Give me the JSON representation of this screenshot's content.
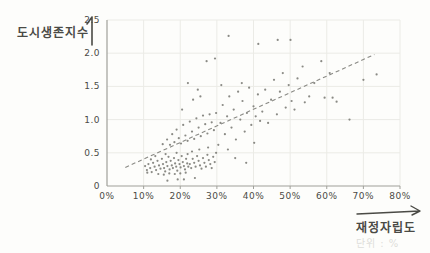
{
  "page": {
    "background": "#fdfdfb"
  },
  "chart_data": {
    "type": "scatter",
    "title": "",
    "ylabel": "도시생존지수",
    "xlabel": "재정자립도",
    "unit_note": "단위 : %",
    "xlim": [
      0,
      80
    ],
    "ylim": [
      0,
      2.5
    ],
    "x_tick_values": [
      0,
      10,
      20,
      30,
      40,
      50,
      60,
      70,
      80
    ],
    "x_tick_labels": [
      "0%",
      "10%",
      "20%",
      "30%",
      "40%",
      "50%",
      "60%",
      "70%",
      "80%"
    ],
    "y_tick_values": [
      0,
      0.5,
      1.0,
      1.5,
      2.0,
      2.5
    ],
    "y_tick_labels": [
      "0",
      "0.5",
      "1.0",
      "1.5",
      "2.0",
      "2.5"
    ],
    "grid": true,
    "legend": "none",
    "trend_line": {
      "style": "dashed",
      "from": {
        "x": 5,
        "y": 0.28
      },
      "to": {
        "x": 73,
        "y": 1.98
      }
    },
    "colors": {
      "point": "#7d7d78",
      "trend": "#8a8a85",
      "grid": "#ebebe6",
      "axis": "#a0a09a",
      "tick_text": "#4b4b46",
      "label_text": "#4a4a45",
      "unit_text": "#dededa"
    },
    "points": [
      [
        10.4,
        0.3
      ],
      [
        10.9,
        0.24
      ],
      [
        11.3,
        0.33
      ],
      [
        11.8,
        0.27
      ],
      [
        12.2,
        0.21
      ],
      [
        12.6,
        0.35
      ],
      [
        13.0,
        0.29
      ],
      [
        13.4,
        0.24
      ],
      [
        13.8,
        0.38
      ],
      [
        14.2,
        0.31
      ],
      [
        14.6,
        0.26
      ],
      [
        15.0,
        0.41
      ],
      [
        15.3,
        0.33
      ],
      [
        15.6,
        0.27
      ],
      [
        15.9,
        0.22
      ],
      [
        16.2,
        0.36
      ],
      [
        16.5,
        0.3
      ],
      [
        16.8,
        0.44
      ],
      [
        17.1,
        0.25
      ],
      [
        17.4,
        0.38
      ],
      [
        17.7,
        0.31
      ],
      [
        18.0,
        0.27
      ],
      [
        18.3,
        0.42
      ],
      [
        18.6,
        0.34
      ],
      [
        18.9,
        0.29
      ],
      [
        19.2,
        0.23
      ],
      [
        19.5,
        0.39
      ],
      [
        19.8,
        0.33
      ],
      [
        20.1,
        0.28
      ],
      [
        20.4,
        0.45
      ],
      [
        20.7,
        0.36
      ],
      [
        21.0,
        0.3
      ],
      [
        21.3,
        0.25
      ],
      [
        21.6,
        0.41
      ],
      [
        21.9,
        0.34
      ],
      [
        22.2,
        0.29
      ],
      [
        14.0,
        0.18
      ],
      [
        15.5,
        0.17
      ],
      [
        17.0,
        0.19
      ],
      [
        18.5,
        0.18
      ],
      [
        20.0,
        0.19
      ],
      [
        21.5,
        0.2
      ],
      [
        13.2,
        0.45
      ],
      [
        16.0,
        0.48
      ],
      [
        19.0,
        0.5
      ],
      [
        12.0,
        0.4
      ],
      [
        22.0,
        0.48
      ],
      [
        11.0,
        0.2
      ],
      [
        22.6,
        0.33
      ],
      [
        23.0,
        0.27
      ],
      [
        23.4,
        0.41
      ],
      [
        23.8,
        0.35
      ],
      [
        24.2,
        0.29
      ],
      [
        24.6,
        0.45
      ],
      [
        25.0,
        0.38
      ],
      [
        25.4,
        0.31
      ],
      [
        25.8,
        0.26
      ],
      [
        26.2,
        0.42
      ],
      [
        26.6,
        0.35
      ],
      [
        27.0,
        0.29
      ],
      [
        27.4,
        0.47
      ],
      [
        27.8,
        0.39
      ],
      [
        28.2,
        0.33
      ],
      [
        28.6,
        0.27
      ],
      [
        29.0,
        0.44
      ],
      [
        29.4,
        0.36
      ],
      [
        25.2,
        0.55
      ],
      [
        27.6,
        0.58
      ],
      [
        23.2,
        0.52
      ],
      [
        29.8,
        0.5
      ],
      [
        15.2,
        0.63
      ],
      [
        16.4,
        0.7
      ],
      [
        17.2,
        0.62
      ],
      [
        17.8,
        0.78
      ],
      [
        18.4,
        0.66
      ],
      [
        19.0,
        0.85
      ],
      [
        19.6,
        0.72
      ],
      [
        20.2,
        0.64
      ],
      [
        20.8,
        0.92
      ],
      [
        21.4,
        0.76
      ],
      [
        22.0,
        0.68
      ],
      [
        22.6,
        0.97
      ],
      [
        23.2,
        0.82
      ],
      [
        23.8,
        0.71
      ],
      [
        24.4,
        1.02
      ],
      [
        25.0,
        0.88
      ],
      [
        25.6,
        0.75
      ],
      [
        26.2,
        1.06
      ],
      [
        26.8,
        0.93
      ],
      [
        27.4,
        0.79
      ],
      [
        28.0,
        1.08
      ],
      [
        28.6,
        0.96
      ],
      [
        29.2,
        0.84
      ],
      [
        29.8,
        1.1
      ],
      [
        22.1,
        1.55
      ],
      [
        23.5,
        1.3
      ],
      [
        25.5,
        1.35
      ],
      [
        20.5,
        1.15
      ],
      [
        24.8,
        1.45
      ],
      [
        30.4,
        0.62
      ],
      [
        31.0,
        0.95
      ],
      [
        31.6,
        1.22
      ],
      [
        32.2,
        0.78
      ],
      [
        32.8,
        1.05
      ],
      [
        33.4,
        1.35
      ],
      [
        34.0,
        0.88
      ],
      [
        34.6,
        1.15
      ],
      [
        35.2,
        0.7
      ],
      [
        35.8,
        1.42
      ],
      [
        36.4,
        1.0
      ],
      [
        37.0,
        1.28
      ],
      [
        37.6,
        0.82
      ],
      [
        38.2,
        1.1
      ],
      [
        38.8,
        1.48
      ],
      [
        39.4,
        0.92
      ],
      [
        40.0,
        1.2
      ],
      [
        40.6,
        1.05
      ],
      [
        41.2,
        1.38
      ],
      [
        41.8,
        0.98
      ],
      [
        35.0,
        0.42
      ],
      [
        38.0,
        0.35
      ],
      [
        33.0,
        0.55
      ],
      [
        40.2,
        0.65
      ],
      [
        31.2,
        1.52
      ],
      [
        36.8,
        1.55
      ],
      [
        42.4,
        1.12
      ],
      [
        43.2,
        1.45
      ],
      [
        44.0,
        0.95
      ],
      [
        44.8,
        1.3
      ],
      [
        45.6,
        1.6
      ],
      [
        46.4,
        1.08
      ],
      [
        47.2,
        1.42
      ],
      [
        48.0,
        1.7
      ],
      [
        48.8,
        1.18
      ],
      [
        49.6,
        1.52
      ],
      [
        50.4,
        1.28
      ],
      [
        51.2,
        1.15
      ],
      [
        52.0,
        1.62
      ],
      [
        53.4,
        1.8
      ],
      [
        54.0,
        1.26
      ],
      [
        55.2,
        1.35
      ],
      [
        56.6,
        1.55
      ],
      [
        58.5,
        1.88
      ],
      [
        59.4,
        1.33
      ],
      [
        60.8,
        1.7
      ],
      [
        61.6,
        1.33
      ],
      [
        62.7,
        1.27
      ],
      [
        66.2,
        1.0
      ],
      [
        70.0,
        1.6
      ],
      [
        73.6,
        1.68
      ],
      [
        27.2,
        1.88
      ],
      [
        29.5,
        1.92
      ],
      [
        33.2,
        2.26
      ],
      [
        41.3,
        2.14
      ],
      [
        46.6,
        2.2
      ],
      [
        50.1,
        2.2
      ],
      [
        16.5,
        0.08
      ],
      [
        19.3,
        0.1
      ],
      [
        21.0,
        0.1
      ],
      [
        24.0,
        0.12
      ]
    ]
  }
}
